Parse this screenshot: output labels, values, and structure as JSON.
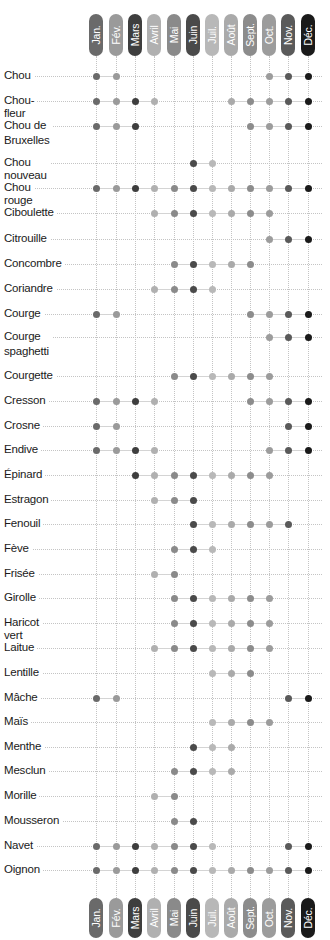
{
  "chart_data": {
    "type": "table",
    "title": "",
    "xlabel": "",
    "ylabel": "",
    "legend": "none",
    "grid": true,
    "months": [
      {
        "label": "Jan.",
        "color": "#6a6a6a"
      },
      {
        "label": "Fév.",
        "color": "#9a9a9a"
      },
      {
        "label": "Mars",
        "color": "#3e3e3e"
      },
      {
        "label": "Avril",
        "color": "#b0b0b0"
      },
      {
        "label": "Mai",
        "color": "#8a8a8a"
      },
      {
        "label": "Juin",
        "color": "#4a4a4a"
      },
      {
        "label": "Juil.",
        "color": "#b8b8b8"
      },
      {
        "label": "Août",
        "color": "#aaaaaa"
      },
      {
        "label": "Sept.",
        "color": "#8c8c8c"
      },
      {
        "label": "Oct.",
        "color": "#9c9c9c"
      },
      {
        "label": "Nov.",
        "color": "#5a5a5a"
      },
      {
        "label": "Déc.",
        "color": "#1a1a1a"
      }
    ],
    "rows": [
      {
        "name": "Chou",
        "months": [
          1,
          2,
          10,
          11,
          12
        ]
      },
      {
        "name": "Chou-fleur",
        "months": [
          1,
          2,
          3,
          4,
          8,
          9,
          10,
          11,
          12
        ]
      },
      {
        "name": "Chou de Bruxelles",
        "months": [
          1,
          2,
          3,
          9,
          10,
          11,
          12
        ]
      },
      {
        "name": "Chou nouveau",
        "months": [
          6,
          7
        ]
      },
      {
        "name": "Chou rouge",
        "months": [
          1,
          2,
          3,
          4,
          5,
          6,
          7,
          8,
          9,
          10,
          11,
          12
        ]
      },
      {
        "name": "Ciboulette",
        "months": [
          4,
          5,
          6,
          7,
          8,
          9,
          10
        ]
      },
      {
        "name": "Citrouille",
        "months": [
          10,
          11,
          12
        ]
      },
      {
        "name": "Concombre",
        "months": [
          5,
          6,
          7,
          8,
          9
        ]
      },
      {
        "name": "Coriandre",
        "months": [
          4,
          5,
          6,
          7
        ]
      },
      {
        "name": "Courge",
        "months": [
          1,
          2,
          9,
          10,
          11,
          12
        ]
      },
      {
        "name": "Courge spaghetti",
        "months": [
          10,
          11,
          12
        ]
      },
      {
        "name": "Courgette",
        "months": [
          5,
          6,
          7,
          8,
          9,
          10
        ]
      },
      {
        "name": "Cresson",
        "months": [
          1,
          2,
          3,
          4,
          9,
          10,
          11,
          12
        ]
      },
      {
        "name": "Crosne",
        "months": [
          1,
          2,
          11,
          12
        ]
      },
      {
        "name": "Endive",
        "months": [
          1,
          2,
          3,
          4,
          10,
          11,
          12
        ]
      },
      {
        "name": "Épinard",
        "months": [
          3,
          4,
          5,
          6,
          7,
          8,
          9,
          10
        ]
      },
      {
        "name": "Estragon",
        "months": [
          4,
          5,
          6
        ]
      },
      {
        "name": "Fenouil",
        "months": [
          6,
          7,
          8,
          9,
          10,
          11
        ]
      },
      {
        "name": "Fève",
        "months": [
          5,
          6,
          7
        ]
      },
      {
        "name": "Frisée",
        "months": [
          4,
          5
        ]
      },
      {
        "name": "Girolle",
        "months": [
          5,
          6,
          7,
          8,
          9,
          10
        ]
      },
      {
        "name": "Haricot vert",
        "months": [
          5,
          6,
          7,
          8,
          9,
          10
        ]
      },
      {
        "name": "Laitue",
        "months": [
          4,
          5,
          6,
          7,
          8,
          9,
          10
        ]
      },
      {
        "name": "Lentille",
        "months": [
          7,
          8,
          9
        ]
      },
      {
        "name": "Mâche",
        "months": [
          1,
          2,
          11,
          12
        ]
      },
      {
        "name": "Maïs",
        "months": [
          7,
          8,
          9,
          10
        ]
      },
      {
        "name": "Menthe",
        "months": [
          6,
          7,
          8
        ]
      },
      {
        "name": "Mesclun",
        "months": [
          5,
          6,
          7,
          8
        ]
      },
      {
        "name": "Morille",
        "months": [
          4,
          5
        ]
      },
      {
        "name": "Mousseron",
        "months": [
          5,
          6
        ]
      },
      {
        "name": "Navet",
        "months": [
          1,
          2,
          3,
          4,
          5,
          6,
          7,
          11,
          12
        ]
      },
      {
        "name": "Oignon",
        "months": [
          1,
          2,
          3,
          4,
          5,
          6,
          7,
          8,
          9,
          10,
          11,
          12
        ]
      }
    ]
  },
  "layout": {
    "row_labels": [
      {
        "line1": "Chou",
        "line2": ""
      },
      {
        "line1": "Chou-fleur",
        "line2": ""
      },
      {
        "line1": "Chou de",
        "line2": "Bruxelles"
      },
      {
        "line1": "Chou nouveau",
        "line2": ""
      },
      {
        "line1": "Chou rouge",
        "line2": ""
      },
      {
        "line1": "Ciboulette",
        "line2": ""
      },
      {
        "line1": "Citrouille",
        "line2": ""
      },
      {
        "line1": "Concombre",
        "line2": ""
      },
      {
        "line1": "Coriandre",
        "line2": ""
      },
      {
        "line1": "Courge",
        "line2": ""
      },
      {
        "line1": "Courge",
        "line2": "spaghetti"
      },
      {
        "line1": "Courgette",
        "line2": ""
      },
      {
        "line1": "Cresson",
        "line2": ""
      },
      {
        "line1": "Crosne",
        "line2": ""
      },
      {
        "line1": "Endive",
        "line2": ""
      },
      {
        "line1": "Épinard",
        "line2": ""
      },
      {
        "line1": "Estragon",
        "line2": ""
      },
      {
        "line1": "Fenouil",
        "line2": ""
      },
      {
        "line1": "Fève",
        "line2": ""
      },
      {
        "line1": "Frisée",
        "line2": ""
      },
      {
        "line1": "Girolle",
        "line2": ""
      },
      {
        "line1": "Haricot vert",
        "line2": ""
      },
      {
        "line1": "Laitue",
        "line2": ""
      },
      {
        "line1": "Lentille",
        "line2": ""
      },
      {
        "line1": "Mâche",
        "line2": ""
      },
      {
        "line1": "Maïs",
        "line2": ""
      },
      {
        "line1": "Menthe",
        "line2": ""
      },
      {
        "line1": "Mesclun",
        "line2": ""
      },
      {
        "line1": "Morille",
        "line2": ""
      },
      {
        "line1": "Mousseron",
        "line2": ""
      },
      {
        "line1": "Navet",
        "line2": ""
      },
      {
        "line1": "Oignon",
        "line2": ""
      }
    ]
  }
}
